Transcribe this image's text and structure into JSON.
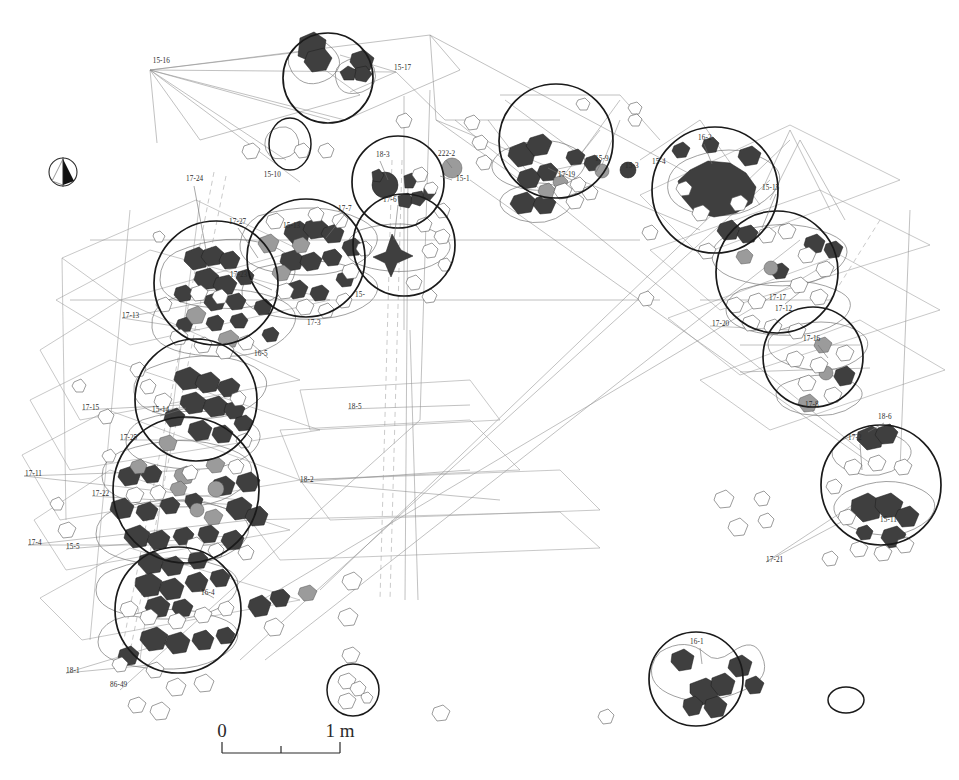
{
  "figure": {
    "type": "archaeological-site-plan",
    "background_color": "#ffffff",
    "ink_color": "#1a1a1a",
    "refit_line_color": "#8d8d8d"
  },
  "scale_bar": {
    "start_label": "0",
    "end_label": "1 m",
    "ticks": [
      "0",
      "",
      "1 m"
    ],
    "x": 222,
    "y": 742,
    "length_px": 118
  },
  "north_arrow": {
    "name": "north-arrow",
    "x": 63,
    "y": 172,
    "radius": 14
  },
  "hearth_circles": [
    {
      "id": "c-top-1",
      "cx": 328,
      "cy": 78,
      "r": 45
    },
    {
      "id": "c-mid-1",
      "cx": 216,
      "cy": 283,
      "r": 62
    },
    {
      "id": "c-mid-2",
      "cx": 306,
      "cy": 258,
      "r": 59
    },
    {
      "id": "c-mid-3",
      "cx": 404,
      "cy": 245,
      "r": 51
    },
    {
      "id": "c-mid-4",
      "cx": 398,
      "cy": 182,
      "r": 46
    },
    {
      "id": "c-left-1",
      "cx": 196,
      "cy": 400,
      "r": 61
    },
    {
      "id": "c-left-2",
      "cx": 186,
      "cy": 490,
      "r": 73
    },
    {
      "id": "c-left-3",
      "cx": 178,
      "cy": 610,
      "r": 63
    },
    {
      "id": "c-cen-1",
      "cx": 556,
      "cy": 141,
      "r": 57
    },
    {
      "id": "c-rt-1",
      "cx": 715,
      "cy": 190,
      "r": 63
    },
    {
      "id": "c-rt-2",
      "cx": 777,
      "cy": 272,
      "r": 61
    },
    {
      "id": "c-rt-3",
      "cx": 813,
      "cy": 357,
      "r": 50
    },
    {
      "id": "c-rt-4",
      "cx": 881,
      "cy": 485,
      "r": 60
    },
    {
      "id": "c-bot-1",
      "cx": 696,
      "cy": 679,
      "r": 47
    },
    {
      "id": "c-small-bot",
      "cx": 353,
      "cy": 690,
      "r": 26
    }
  ],
  "labels": [
    {
      "text": "15-16",
      "x": 170,
      "y": 63,
      "anchor": "end"
    },
    {
      "text": "15-17",
      "x": 394,
      "y": 70,
      "anchor": "start"
    },
    {
      "text": "15-10",
      "x": 281,
      "y": 177,
      "anchor": "end"
    },
    {
      "text": "18-3",
      "x": 376,
      "y": 157,
      "anchor": "start"
    },
    {
      "text": "222-2",
      "x": 438,
      "y": 156,
      "anchor": "start"
    },
    {
      "text": "15-1",
      "x": 456,
      "y": 181,
      "anchor": "start"
    },
    {
      "text": "17-6",
      "x": 383,
      "y": 202,
      "anchor": "start"
    },
    {
      "text": "17-24",
      "x": 186,
      "y": 181,
      "anchor": "start"
    },
    {
      "text": "17-27",
      "x": 229,
      "y": 224,
      "anchor": "start"
    },
    {
      "text": "15-13",
      "x": 283,
      "y": 228,
      "anchor": "start"
    },
    {
      "text": "17-7",
      "x": 338,
      "y": 211,
      "anchor": "start"
    },
    {
      "text": "17-23",
      "x": 230,
      "y": 277,
      "anchor": "start"
    },
    {
      "text": "17-13",
      "x": 122,
      "y": 318,
      "anchor": "start"
    },
    {
      "text": "17-3",
      "x": 307,
      "y": 325,
      "anchor": "start"
    },
    {
      "text": "16-5",
      "x": 254,
      "y": 356,
      "anchor": "start"
    },
    {
      "text": "15-",
      "x": 355,
      "y": 297,
      "anchor": "start"
    },
    {
      "text": "15-14",
      "x": 152,
      "y": 412,
      "anchor": "start"
    },
    {
      "text": "17-15",
      "x": 82,
      "y": 410,
      "anchor": "start"
    },
    {
      "text": "17-25",
      "x": 120,
      "y": 440,
      "anchor": "start"
    },
    {
      "text": "17-11",
      "x": 25,
      "y": 476,
      "anchor": "start"
    },
    {
      "text": "17-22",
      "x": 92,
      "y": 496,
      "anchor": "start"
    },
    {
      "text": "17-4",
      "x": 28,
      "y": 545,
      "anchor": "start"
    },
    {
      "text": "15-5",
      "x": 66,
      "y": 549,
      "anchor": "start"
    },
    {
      "text": "18-5",
      "x": 348,
      "y": 409,
      "anchor": "start"
    },
    {
      "text": "18-2",
      "x": 300,
      "y": 482,
      "anchor": "start"
    },
    {
      "text": "16-4",
      "x": 201,
      "y": 595,
      "anchor": "start"
    },
    {
      "text": "18-1",
      "x": 66,
      "y": 673,
      "anchor": "start"
    },
    {
      "text": "86-49",
      "x": 110,
      "y": 687,
      "anchor": "start"
    },
    {
      "text": "17-19",
      "x": 558,
      "y": 177,
      "anchor": "start"
    },
    {
      "text": "15-9",
      "x": 595,
      "y": 161,
      "anchor": "start"
    },
    {
      "text": "15-3",
      "x": 625,
      "y": 168,
      "anchor": "start"
    },
    {
      "text": "15-4",
      "x": 652,
      "y": 164,
      "anchor": "start"
    },
    {
      "text": "16-2",
      "x": 698,
      "y": 140,
      "anchor": "start"
    },
    {
      "text": "15-15",
      "x": 762,
      "y": 190,
      "anchor": "start"
    },
    {
      "text": "17-17",
      "x": 769,
      "y": 300,
      "anchor": "start"
    },
    {
      "text": "17-12",
      "x": 775,
      "y": 311,
      "anchor": "start"
    },
    {
      "text": "17-20",
      "x": 712,
      "y": 326,
      "anchor": "start"
    },
    {
      "text": "17-16",
      "x": 803,
      "y": 341,
      "anchor": "start"
    },
    {
      "text": "17-8",
      "x": 805,
      "y": 407,
      "anchor": "start"
    },
    {
      "text": "18-6",
      "x": 878,
      "y": 419,
      "anchor": "start"
    },
    {
      "text": "17-2",
      "x": 848,
      "y": 440,
      "anchor": "start"
    },
    {
      "text": "15-11",
      "x": 880,
      "y": 522,
      "anchor": "start"
    },
    {
      "text": "17-21",
      "x": 766,
      "y": 562,
      "anchor": "start"
    },
    {
      "text": "16-1",
      "x": 690,
      "y": 644,
      "anchor": "start"
    }
  ],
  "label_count": 44,
  "circle_count": 15
}
